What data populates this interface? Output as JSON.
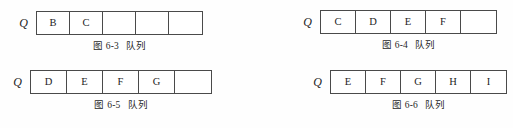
{
  "page": {
    "background_color": "#fefefe",
    "border_color": "#4a4a4a",
    "text_color": "#1c1c1c"
  },
  "figures": [
    {
      "id": "fig-6-3",
      "label": "Q",
      "caption_number": "图 6-3",
      "caption_word": "队列",
      "cell_width": 33,
      "cells": [
        {
          "value": "B",
          "empty": false
        },
        {
          "value": "C",
          "empty": false
        },
        {
          "value": "",
          "empty": true
        },
        {
          "value": "",
          "empty": true
        },
        {
          "value": "",
          "empty": true
        }
      ]
    },
    {
      "id": "fig-6-4",
      "label": "Q",
      "caption_number": "图 6-4",
      "caption_word": "队列",
      "cell_width": 35,
      "cells": [
        {
          "value": "C",
          "empty": false
        },
        {
          "value": "D",
          "empty": false
        },
        {
          "value": "E",
          "empty": false
        },
        {
          "value": "F",
          "empty": false
        },
        {
          "value": "",
          "empty": true
        }
      ]
    },
    {
      "id": "fig-6-5",
      "label": "Q",
      "caption_number": "图 6-5",
      "caption_word": "队列",
      "cell_width": 36,
      "cells": [
        {
          "value": "D",
          "empty": false
        },
        {
          "value": "E",
          "empty": false
        },
        {
          "value": "F",
          "empty": false
        },
        {
          "value": "G",
          "empty": false
        },
        {
          "value": "",
          "empty": true
        }
      ]
    },
    {
      "id": "fig-6-6",
      "label": "Q",
      "caption_number": "图 6-6",
      "caption_word": "队列",
      "cell_width": 35,
      "cells": [
        {
          "value": "E",
          "empty": false
        },
        {
          "value": "F",
          "empty": false
        },
        {
          "value": "G",
          "empty": false
        },
        {
          "value": "H",
          "empty": false
        },
        {
          "value": "I",
          "empty": false
        }
      ]
    }
  ]
}
